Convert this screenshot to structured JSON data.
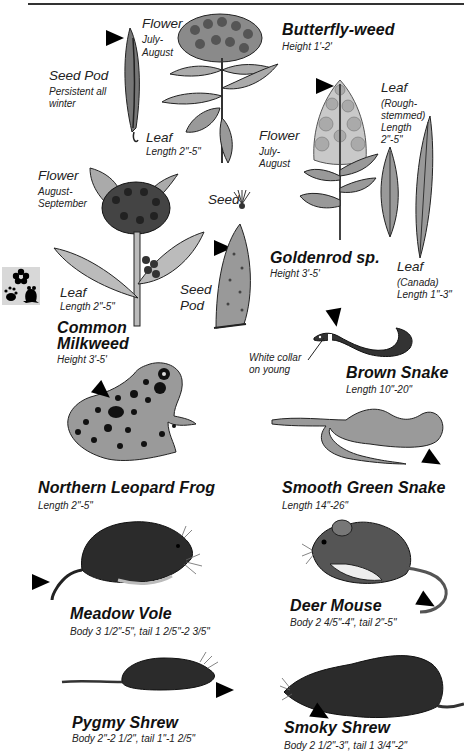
{
  "page": {
    "header_rule": true
  },
  "plants": {
    "butterfly_weed": {
      "name": "Butterfly-weed",
      "height": "Height 1'-2'",
      "flower_label": "Flower",
      "flower_period": [
        "July-",
        "August"
      ],
      "seed_pod_label": "Seed Pod",
      "seed_pod_note": [
        "Persistent all",
        "winter"
      ],
      "leaf_label": "Leaf",
      "leaf_length": "Length 2\"-5\""
    },
    "goldenrod": {
      "name": "Goldenrod sp.",
      "height": "Height 3'-5'",
      "flower_label": "Flower",
      "flower_period": [
        "July-",
        "August"
      ],
      "leaf_rough_label": "Leaf",
      "leaf_rough_note": [
        "(Rough-",
        "stemmed)",
        "Length",
        "2\"-5\""
      ],
      "leaf_canada_label": "Leaf",
      "leaf_canada_note": [
        "(Canada)",
        "Length 1\"-3\""
      ]
    },
    "common_milkweed": {
      "name_line1": "Common",
      "name_line2": "Milkweed",
      "height": "Height 3'-5'",
      "flower_label": "Flower",
      "flower_period": [
        "August-",
        "September"
      ],
      "seed_label": "Seed",
      "seed_pod_label": [
        "Seed",
        "Pod"
      ],
      "leaf_label": "Leaf",
      "leaf_length": "Length 2\"-5\""
    }
  },
  "animals": {
    "brown_snake": {
      "name": "Brown Snake",
      "length": "Length 10\"-20\"",
      "callout": [
        "White collar",
        "on young"
      ]
    },
    "smooth_green_snake": {
      "name": "Smooth Green Snake",
      "length": "Length 14\"-26\""
    },
    "northern_leopard_frog": {
      "name": "Northern Leopard Frog",
      "length": "Length 2\"-5\""
    },
    "meadow_vole": {
      "name": "Meadow Vole",
      "size": "Body 3 1/2\"-5\", tail 1 2/5\"-2 3/5\""
    },
    "deer_mouse": {
      "name": "Deer Mouse",
      "size": "Body 2 4/5\"-4\", tail 2\"-5\""
    },
    "pygmy_shrew": {
      "name": "Pygmy Shrew",
      "size": "Body 2\"-2 1/2\", tail 1\"-1 2/5\""
    },
    "smoky_shrew": {
      "name": "Smoky Shrew",
      "size": "Body 2 1/2\"-3\", tail 1 3/4\"-2\""
    }
  },
  "badge": {
    "icon": "flower-paw-frog-icon"
  },
  "colors": {
    "ink": "#111111",
    "illustration_fill": "#9a9a9a",
    "dark_fur": "#2b2b2b",
    "badge_bg": "#d8d8d8"
  }
}
